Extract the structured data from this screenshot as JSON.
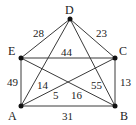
{
  "diagram": {
    "type": "weighted-graph",
    "nodes": [
      {
        "id": "A",
        "label": "A"
      },
      {
        "id": "B",
        "label": "B"
      },
      {
        "id": "C",
        "label": "C"
      },
      {
        "id": "D",
        "label": "D"
      },
      {
        "id": "E",
        "label": "E"
      }
    ],
    "edges": [
      {
        "from": "D",
        "to": "E",
        "weight": "28"
      },
      {
        "from": "D",
        "to": "C",
        "weight": "23"
      },
      {
        "from": "E",
        "to": "C",
        "weight": "44"
      },
      {
        "from": "E",
        "to": "A",
        "weight": "49"
      },
      {
        "from": "C",
        "to": "B",
        "weight": "13"
      },
      {
        "from": "A",
        "to": "B",
        "weight": "31"
      },
      {
        "from": "A",
        "to": "D",
        "weight": "14"
      },
      {
        "from": "D",
        "to": "B",
        "weight": "55"
      },
      {
        "from": "A",
        "to": "C",
        "weight": "5"
      },
      {
        "from": "E",
        "to": "B",
        "weight": "16"
      }
    ]
  }
}
